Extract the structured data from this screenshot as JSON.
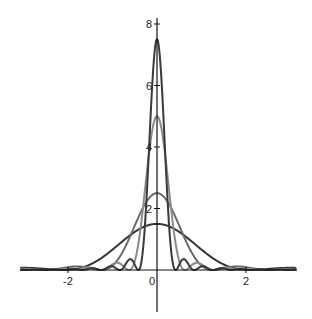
{
  "chart_data": {
    "type": "line",
    "title": "",
    "xlabel": "",
    "ylabel": "",
    "xlim": [
      -3.07,
      3.13
    ],
    "ylim": [
      -1.2,
      8.4
    ],
    "grid": false,
    "legend": null,
    "x_ticks": [
      {
        "value": -2,
        "label": "-2"
      },
      {
        "value": 0,
        "label": "0"
      },
      {
        "value": 2,
        "label": "2"
      }
    ],
    "y_ticks": [
      {
        "value": 2,
        "label": "2"
      },
      {
        "value": 4,
        "label": "4"
      },
      {
        "value": 6,
        "label": "6"
      },
      {
        "value": 8,
        "label": "8"
      }
    ],
    "function": "A * (sin(A x) / (A x))^2",
    "series": [
      {
        "name": "A=1.5",
        "peak": 1.5,
        "first_zero": 2.09,
        "color": "#333333"
      },
      {
        "name": "A=2.5",
        "peak": 2.5,
        "first_zero": 1.26,
        "color": "#6a6a6a"
      },
      {
        "name": "A=5",
        "peak": 5,
        "first_zero": 0.63,
        "color": "#8a8a8a"
      },
      {
        "name": "A=7.5",
        "peak": 7.5,
        "first_zero": 0.42,
        "color": "#3a3a3a"
      }
    ]
  },
  "layout": {
    "origin_px": [
      157,
      270
    ],
    "px_per_x": 44.5,
    "px_per_y": 30.75
  }
}
